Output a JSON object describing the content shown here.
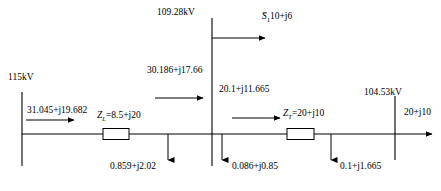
{
  "diagram": {
    "type": "power-system-single-line",
    "title": "",
    "buses": [
      {
        "id": "bus-sending",
        "voltage_label": "115kV",
        "x": 22
      },
      {
        "id": "bus-middle",
        "voltage_label": "109.28kV",
        "x": 212
      },
      {
        "id": "bus-receiving",
        "voltage_label": "104.53kV",
        "x": 395
      }
    ],
    "impedances": [
      {
        "id": "line-impedance",
        "symbol": "Z",
        "subscript": "L",
        "value": "8.5+j20",
        "label": "Zₗ=8.5+j20"
      },
      {
        "id": "transformer-impedance",
        "symbol": "Z",
        "subscript": "T",
        "value": "20+j10",
        "label": "Zₜ=20+j10"
      }
    ],
    "flows": [
      {
        "id": "flow-sending-end",
        "label": "31.045+j19.682"
      },
      {
        "id": "flow-line-receiving",
        "label": "30.186+j17.66"
      },
      {
        "id": "flow-transformer-sending",
        "label": "20.1+j11.665"
      },
      {
        "id": "flow-tap-load",
        "symbol": "S",
        "subscript": "1",
        "value": "10+j6",
        "label": "=10+j6"
      },
      {
        "id": "flow-output-load",
        "label": "20+j10"
      }
    ],
    "losses": [
      {
        "id": "loss-line",
        "label": "0.859+j2.02"
      },
      {
        "id": "loss-middle-bus",
        "label": "0.086+j0.85"
      },
      {
        "id": "loss-transformer",
        "label": "0.1+j1.665"
      }
    ],
    "colors": {
      "line": "#000000",
      "background": "#ffffff",
      "text": "#000000"
    }
  }
}
